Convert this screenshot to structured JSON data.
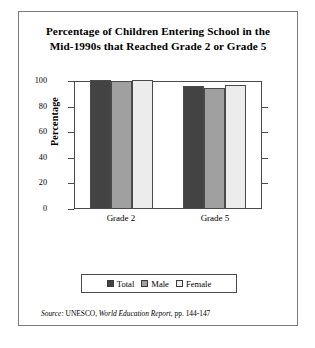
{
  "figure": {
    "title_line1": "Percentage of Children Entering School in the",
    "title_line2": "Mid-1990s that Reached Grade 2 or Grade 5",
    "source_prefix": "Source:",
    "source_publisher": "UNESCO,",
    "source_report": "World Education Report",
    "source_pages": ", pp. 144-147"
  },
  "colors": {
    "total": "#434343",
    "male": "#a0a0a0",
    "female": "#ececec",
    "axis": "#4a4a4a",
    "frame": "#7a7a7a"
  },
  "chart_data": {
    "type": "bar",
    "title": "Percentage of Children Entering School in the Mid-1990s that Reached Grade 2 or Grade 5",
    "xlabel": "",
    "ylabel": "Percentage",
    "categories": [
      "Grade 2",
      "Grade 5"
    ],
    "series": [
      {
        "name": "Total",
        "values": [
          100,
          95
        ]
      },
      {
        "name": "Male",
        "values": [
          99,
          94
        ]
      },
      {
        "name": "Female",
        "values": [
          100,
          96
        ]
      }
    ],
    "ylim": [
      0,
      100
    ],
    "yticks": [
      0,
      20,
      40,
      60,
      80,
      100
    ],
    "ytick_labels": [
      "0",
      "20",
      "40",
      "60",
      "80",
      "100"
    ],
    "grid": false,
    "legend_position": "bottom"
  }
}
